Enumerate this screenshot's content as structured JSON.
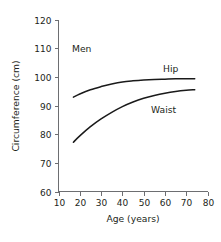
{
  "chart_data": {
    "type": "line",
    "title": "",
    "xlabel": "Age (years)",
    "ylabel": "Circumference (cm)",
    "group_annotation": "Men",
    "xlim": [
      10,
      80
    ],
    "ylim": [
      60,
      120
    ],
    "xticks": [
      10,
      20,
      30,
      40,
      50,
      60,
      70,
      80
    ],
    "yticks": [
      60,
      70,
      80,
      90,
      100,
      110,
      120
    ],
    "xtick_labels": [
      "10",
      "20",
      "30",
      "40",
      "50",
      "60",
      "70",
      "80"
    ],
    "ytick_labels": [
      "60",
      "70",
      "80",
      "90",
      "100",
      "110",
      "120"
    ],
    "grid": false,
    "legend_position": "inline-curve-labels",
    "series": [
      {
        "name": "Hip",
        "label": "Hip",
        "color": "#1a1a1a",
        "x": [
          17,
          20,
          25,
          30,
          35,
          40,
          45,
          50,
          55,
          60,
          65,
          70,
          74
        ],
        "values": [
          92.9,
          94.0,
          95.5,
          96.6,
          97.5,
          98.2,
          98.6,
          98.9,
          99.1,
          99.2,
          99.3,
          99.3,
          99.3
        ]
      },
      {
        "name": "Waist",
        "label": "Waist",
        "color": "#1a1a1a",
        "x": [
          17,
          20,
          25,
          30,
          35,
          40,
          45,
          50,
          55,
          60,
          65,
          70,
          74
        ],
        "values": [
          77.2,
          79.4,
          82.6,
          85.3,
          87.6,
          89.6,
          91.2,
          92.5,
          93.5,
          94.3,
          94.9,
          95.3,
          95.5
        ]
      }
    ]
  },
  "annotations": {
    "men": "Men",
    "hip": "Hip",
    "waist": "Waist"
  }
}
